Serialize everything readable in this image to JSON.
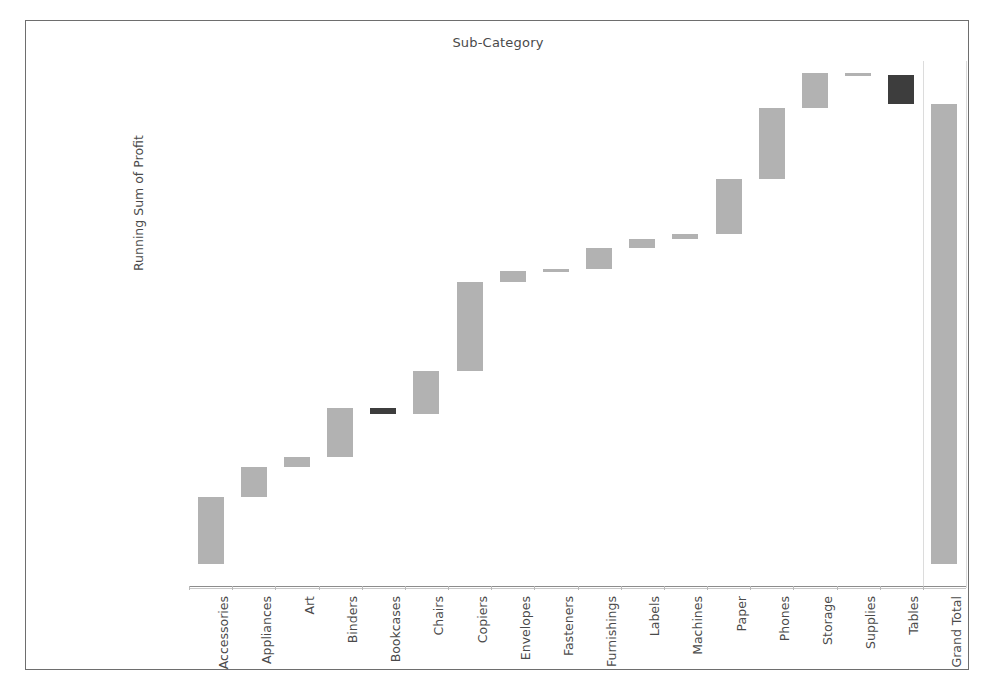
{
  "chart_title": "Sub-Category",
  "axis": {
    "ylabel": "Running Sum of Profit",
    "yticks": [
      "$0",
      "$50,000",
      "$100,000",
      "$150,000",
      "$200,000",
      "$250,000",
      "$300,000"
    ],
    "ytick_values": [
      0,
      50000,
      100000,
      150000,
      200000,
      250000,
      300000
    ],
    "ylim": [
      0,
      313000
    ],
    "grid": false
  },
  "colors": {
    "positive_bar": "#b2b2b2",
    "negative_bar": "#3d3d3d",
    "axis_text": "#4a4a4a",
    "frame_border": "#6e6e6e",
    "separator": "#dcdcdc"
  },
  "chart_data": {
    "type": "bar",
    "subtype": "waterfall",
    "title": "Sub-Category",
    "xlabel": "",
    "ylabel": "Running Sum of Profit",
    "ylim": [
      0,
      313000
    ],
    "grid": false,
    "legend": "none",
    "categories": [
      "Accessories",
      "Appliances",
      "Art",
      "Binders",
      "Bookcases",
      "Chairs",
      "Copiers",
      "Envelopes",
      "Fasteners",
      "Furnishings",
      "Labels",
      "Machines",
      "Paper",
      "Phones",
      "Storage",
      "Supplies",
      "Tables",
      "Grand Total"
    ],
    "deltas": [
      41937,
      18138,
      6528,
      30222,
      -3473,
      26590,
      55618,
      6964,
      950,
      13059,
      5546,
      3385,
      34054,
      44516,
      21279,
      -1189,
      -17725,
      null
    ],
    "running_sum": [
      41937,
      60075,
      66603,
      96825,
      93352,
      119942,
      175560,
      182524,
      183474,
      196533,
      202079,
      205464,
      239518,
      284034,
      305313,
      304124,
      286399,
      286399
    ],
    "bars": [
      {
        "label": "Accessories",
        "start": 0,
        "end": 41937,
        "sign": "positive"
      },
      {
        "label": "Appliances",
        "start": 41937,
        "end": 60075,
        "sign": "positive"
      },
      {
        "label": "Art",
        "start": 60075,
        "end": 66603,
        "sign": "positive"
      },
      {
        "label": "Binders",
        "start": 66603,
        "end": 96825,
        "sign": "positive"
      },
      {
        "label": "Bookcases",
        "start": 96825,
        "end": 93352,
        "sign": "negative"
      },
      {
        "label": "Chairs",
        "start": 93352,
        "end": 119942,
        "sign": "positive"
      },
      {
        "label": "Copiers",
        "start": 119942,
        "end": 175560,
        "sign": "positive"
      },
      {
        "label": "Envelopes",
        "start": 175560,
        "end": 182524,
        "sign": "positive"
      },
      {
        "label": "Fasteners",
        "start": 182524,
        "end": 183474,
        "sign": "positive"
      },
      {
        "label": "Furnishings",
        "start": 183474,
        "end": 196533,
        "sign": "positive"
      },
      {
        "label": "Labels",
        "start": 196533,
        "end": 202079,
        "sign": "positive"
      },
      {
        "label": "Machines",
        "start": 202079,
        "end": 205464,
        "sign": "positive"
      },
      {
        "label": "Paper",
        "start": 205464,
        "end": 239518,
        "sign": "positive"
      },
      {
        "label": "Phones",
        "start": 239518,
        "end": 284034,
        "sign": "positive"
      },
      {
        "label": "Storage",
        "start": 284034,
        "end": 305313,
        "sign": "positive"
      },
      {
        "label": "Supplies",
        "start": 305313,
        "end": 304124,
        "sign": "positive"
      },
      {
        "label": "Tables",
        "start": 304124,
        "end": 286399,
        "sign": "negative"
      },
      {
        "label": "Grand Total",
        "start": 0,
        "end": 286399,
        "sign": "total"
      }
    ]
  }
}
